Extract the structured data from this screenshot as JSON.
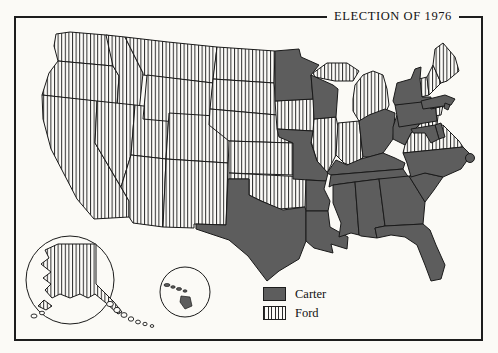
{
  "title": "ELECTION OF 1976",
  "legend": {
    "carter_label": "Carter",
    "ford_label": "Ford",
    "carter_color": "#5d5d5d",
    "ford_pattern": "vertical-stripes"
  },
  "map": {
    "type": "choropleth-election-map",
    "carter_states": [
      "MN",
      "WI",
      "MO",
      "TX",
      "AR",
      "LA",
      "MS",
      "AL",
      "GA",
      "FL",
      "SC",
      "NC",
      "TN",
      "KY",
      "WV",
      "OH",
      "PA",
      "NY",
      "MA",
      "RI",
      "DE",
      "MD",
      "HI",
      "DC"
    ],
    "ford_states": [
      "WA",
      "OR",
      "CA",
      "ID",
      "NV",
      "MT",
      "WY",
      "UT",
      "AZ",
      "CO",
      "NM",
      "ND",
      "SD",
      "NE",
      "KS",
      "OK",
      "IA",
      "IL",
      "IN",
      "MI",
      "VA",
      "NJ",
      "CT",
      "VT",
      "NH",
      "ME",
      "AK"
    ],
    "insets": {
      "alaska": "Alaska",
      "hawaii": "Hawaii"
    }
  },
  "colors": {
    "ink": "#1a1a1a",
    "paper": "#fbfaf6"
  }
}
